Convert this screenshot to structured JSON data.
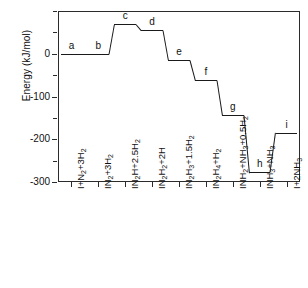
{
  "chart_data": {
    "type": "line",
    "title": "",
    "xlabel": "",
    "ylabel": "Energy (kJ/mol)",
    "ylim": [
      -300,
      100
    ],
    "yticks": [
      0,
      -100,
      -200,
      -300
    ],
    "ytick_labels": [
      "0",
      "-100",
      "-200",
      "-300"
    ],
    "grid": false,
    "legend": false,
    "categories": [
      "I+N2+3H2",
      "IN2+3H2",
      "IN2H+2.5H2",
      "IN2H2+2H",
      "IN2H3+1.5H2",
      "IN2H4+H2",
      "INH2+NH3+0.5H2",
      "INH3+NH3",
      "I+2NH3"
    ],
    "values": [
      0,
      0,
      70,
      55,
      -15,
      -62,
      -143,
      -277,
      -185
    ],
    "point_labels": [
      "a",
      "b",
      "c",
      "d",
      "e",
      "f",
      "g",
      "h",
      "i"
    ],
    "series": [
      {
        "name": "Reaction energy profile",
        "values": [
          0,
          0,
          70,
          55,
          -15,
          -62,
          -143,
          -277,
          -185
        ]
      }
    ]
  },
  "axis": {
    "y_title": "Energy (kJ/mol)",
    "y_tick_labels": [
      "0",
      "-100",
      "-200",
      "-300"
    ]
  },
  "x_labels": [
    {
      "parts": [
        {
          "t": "I+N",
          "sub": false
        },
        {
          "t": "2",
          "sub": true
        },
        {
          "t": "+3H",
          "sub": false
        },
        {
          "t": "2",
          "sub": true
        }
      ]
    },
    {
      "parts": [
        {
          "t": "IN",
          "sub": false
        },
        {
          "t": "2",
          "sub": true
        },
        {
          "t": "+3H",
          "sub": false
        },
        {
          "t": "2",
          "sub": true
        }
      ]
    },
    {
      "parts": [
        {
          "t": "IN",
          "sub": false
        },
        {
          "t": "2",
          "sub": true
        },
        {
          "t": "H+2.5H",
          "sub": false
        },
        {
          "t": "2",
          "sub": true
        }
      ]
    },
    {
      "parts": [
        {
          "t": "IN",
          "sub": false
        },
        {
          "t": "2",
          "sub": true
        },
        {
          "t": "H",
          "sub": false
        },
        {
          "t": "2",
          "sub": true
        },
        {
          "t": "+2H",
          "sub": false
        }
      ]
    },
    {
      "parts": [
        {
          "t": "IN",
          "sub": false
        },
        {
          "t": "2",
          "sub": true
        },
        {
          "t": "H",
          "sub": false
        },
        {
          "t": "3",
          "sub": true
        },
        {
          "t": "+1.5H",
          "sub": false
        },
        {
          "t": "2",
          "sub": true
        }
      ]
    },
    {
      "parts": [
        {
          "t": "IN",
          "sub": false
        },
        {
          "t": "2",
          "sub": true
        },
        {
          "t": "H",
          "sub": false
        },
        {
          "t": "4",
          "sub": true
        },
        {
          "t": "+H",
          "sub": false
        },
        {
          "t": "2",
          "sub": true
        }
      ]
    },
    {
      "parts": [
        {
          "t": "INH",
          "sub": false
        },
        {
          "t": "2",
          "sub": true
        },
        {
          "t": "+NH",
          "sub": false
        },
        {
          "t": "3",
          "sub": true
        },
        {
          "t": "+0.5H",
          "sub": false
        },
        {
          "t": "2",
          "sub": true
        }
      ]
    },
    {
      "parts": [
        {
          "t": "INH",
          "sub": false
        },
        {
          "t": "3",
          "sub": true
        },
        {
          "t": "+NH",
          "sub": false
        },
        {
          "t": "3",
          "sub": true
        }
      ]
    },
    {
      "parts": [
        {
          "t": "I+2NH",
          "sub": false
        },
        {
          "t": "3",
          "sub": true
        }
      ]
    }
  ],
  "style": {
    "line_color": "#1a1a1a",
    "axis_color": "#2b2b2b",
    "background": "#ffffff"
  }
}
